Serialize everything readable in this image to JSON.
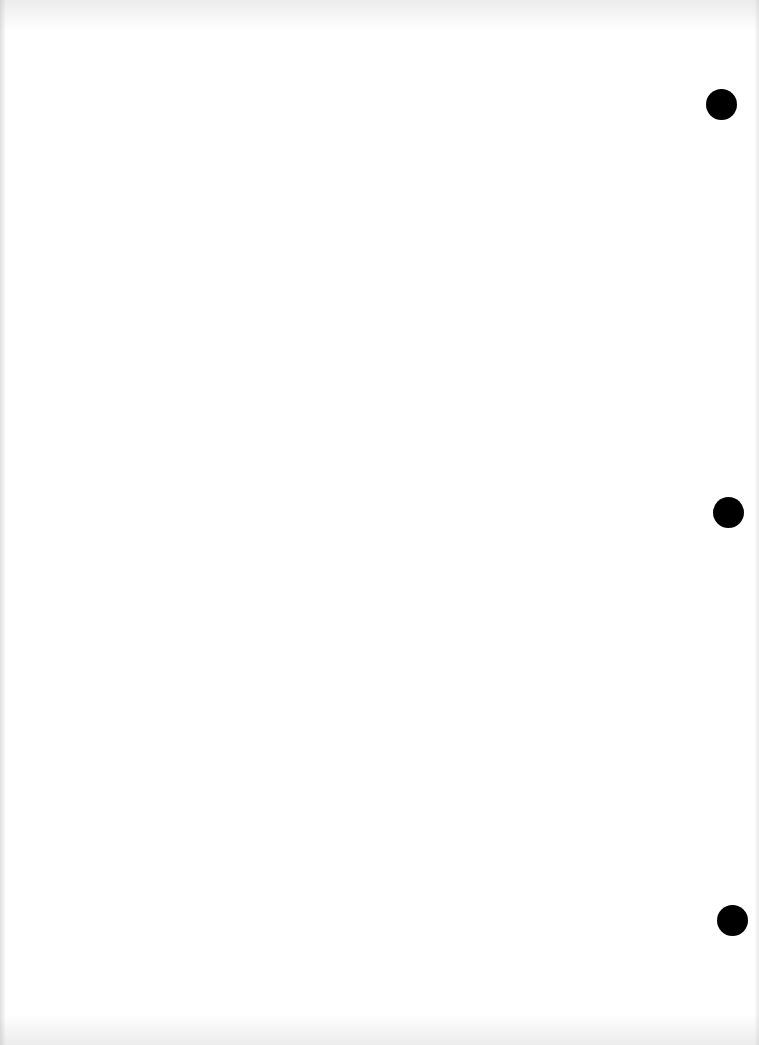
{
  "document": {
    "type": "blank scanned page",
    "text": "",
    "punch_holes": 3
  }
}
